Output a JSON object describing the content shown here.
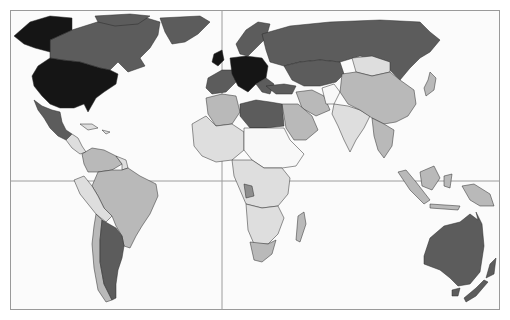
{
  "map": {
    "type": "world-choropleth",
    "projection": "equirectangular-like, Pacific-centered cut at Americas",
    "frame": {
      "x": 10,
      "y": 10,
      "width": 490,
      "height": 300
    },
    "gridlines": {
      "prime_meridian_x": 222,
      "equator_y": 181
    },
    "shade_scale": {
      "black": "#151515",
      "dark": "#5c5c5c",
      "medium": "#8e8e8e",
      "light": "#b9b9b9",
      "pale": "#dedede",
      "white": "#f8f8f8"
    },
    "regions": [
      {
        "name": "Alaska",
        "shade": "black"
      },
      {
        "name": "Canada",
        "shade": "dark"
      },
      {
        "name": "Greenland",
        "shade": "dark"
      },
      {
        "name": "United States",
        "shade": "black"
      },
      {
        "name": "Mexico",
        "shade": "dark"
      },
      {
        "name": "Central America",
        "shade": "pale"
      },
      {
        "name": "Caribbean",
        "shade": "pale"
      },
      {
        "name": "Venezuela/Colombia",
        "shade": "light"
      },
      {
        "name": "Brazil",
        "shade": "light"
      },
      {
        "name": "Peru/Bolivia",
        "shade": "pale"
      },
      {
        "name": "Chile",
        "shade": "light"
      },
      {
        "name": "Argentina",
        "shade": "dark"
      },
      {
        "name": "Western Europe",
        "shade": "dark"
      },
      {
        "name": "Central Europe",
        "shade": "black"
      },
      {
        "name": "Scandinavia",
        "shade": "dark"
      },
      {
        "name": "Russia",
        "shade": "dark"
      },
      {
        "name": "Central Asia",
        "shade": "dark"
      },
      {
        "name": "North Africa (Algeria)",
        "shade": "light"
      },
      {
        "name": "Libya/Egypt",
        "shade": "dark"
      },
      {
        "name": "West Africa",
        "shade": "pale"
      },
      {
        "name": "Sahel/Sudan",
        "shade": "white"
      },
      {
        "name": "Central Africa",
        "shade": "pale"
      },
      {
        "name": "Southern Africa",
        "shade": "pale"
      },
      {
        "name": "South Africa",
        "shade": "light"
      },
      {
        "name": "Madagascar",
        "shade": "light"
      },
      {
        "name": "Arabian Peninsula",
        "shade": "light"
      },
      {
        "name": "Iran",
        "shade": "light"
      },
      {
        "name": "Afghanistan",
        "shade": "white"
      },
      {
        "name": "India",
        "shade": "pale"
      },
      {
        "name": "China",
        "shade": "light"
      },
      {
        "name": "Mongolia",
        "shade": "pale"
      },
      {
        "name": "Japan",
        "shade": "light"
      },
      {
        "name": "Southeast Asia",
        "shade": "light"
      },
      {
        "name": "Indonesia",
        "shade": "light"
      },
      {
        "name": "Papua New Guinea",
        "shade": "light"
      },
      {
        "name": "Australia",
        "shade": "dark"
      },
      {
        "name": "New Zealand",
        "shade": "dark"
      }
    ]
  }
}
